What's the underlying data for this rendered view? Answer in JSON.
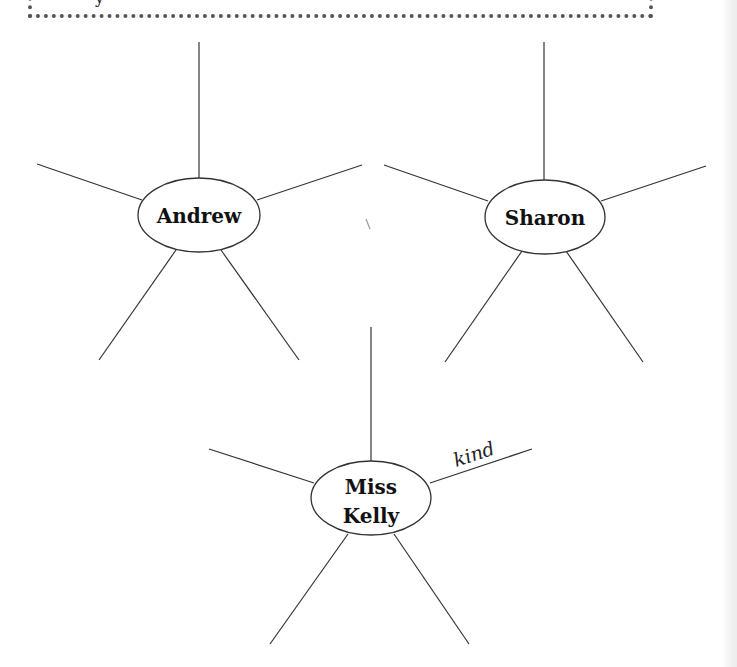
{
  "header_box": {
    "text_fragment": "y"
  },
  "webs": [
    {
      "center": "Andrew",
      "lines": [
        "Andrew"
      ],
      "spoke_labels": [
        "",
        "",
        "",
        "",
        ""
      ]
    },
    {
      "center": "Sharon",
      "lines": [
        "Sharon"
      ],
      "spoke_labels": [
        "",
        "",
        "",
        "",
        ""
      ]
    },
    {
      "center": "Miss Kelly",
      "lines": [
        "Miss",
        "Kelly"
      ],
      "spoke_labels": [
        "",
        "",
        "kind",
        "",
        ""
      ]
    }
  ],
  "colors": {
    "ink": "#333333",
    "frame": "#555555"
  }
}
